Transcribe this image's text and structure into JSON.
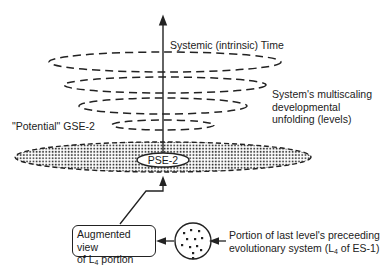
{
  "diagram": {
    "axis_label": "Systemic (intrinsic) Time",
    "levels_label": [
      "System's multiscaling",
      "developmental",
      "unfolding (levels)"
    ],
    "potential_label": "\"Potential\" GSE-2",
    "core_label": "PSE-2",
    "augmented_box": {
      "line1": "Augmented view",
      "line2_prefix": "of L",
      "line2_sub": "4",
      "line2_suffix": " portion"
    },
    "portion_label": {
      "line1": "Portion of last level's preceeding",
      "line2_prefix": "evolutionary system (L",
      "line2_sub": "4",
      "line2_suffix": " of ES-1)"
    },
    "dashed_levels_count": 4
  }
}
